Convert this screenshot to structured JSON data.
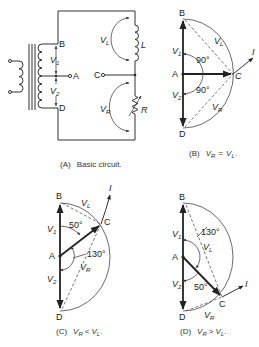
{
  "figure": {
    "panels": [
      {
        "id": "A",
        "caption_tag": "(A)",
        "caption_text": "Basic circuit.",
        "labels": {
          "B": "B",
          "A": "A",
          "C": "C",
          "D": "D",
          "V1": "V",
          "V1_sub": "1",
          "V2": "V",
          "V2_sub": "2",
          "VL": "V",
          "VL_sub": "L",
          "VR": "V",
          "VR_sub": "R",
          "L": "L",
          "R": "R"
        },
        "components": [
          "transformer",
          "inductor-L",
          "variable-resistor-R"
        ]
      },
      {
        "id": "B",
        "caption_tag": "(B)",
        "caption_expr": {
          "lhs": "V",
          "lhs_sub": "R",
          "op": "=",
          "rhs": "V",
          "rhs_sub": "L",
          "end": "."
        },
        "labels": {
          "B": "B",
          "A": "A",
          "C": "C",
          "D": "D",
          "I": "I",
          "V1": "V",
          "V1_sub": "1",
          "V2": "V",
          "V2_sub": "2",
          "VL": "V",
          "VL_sub": "L",
          "VR": "V",
          "VR_sub": "R"
        },
        "angles": [
          "90°",
          "90°"
        ]
      },
      {
        "id": "C",
        "caption_tag": "(C)",
        "caption_expr": {
          "lhs": "V",
          "lhs_sub": "R",
          "op": "<",
          "rhs": "V",
          "rhs_sub": "L",
          "end": "."
        },
        "labels": {
          "B": "B",
          "A": "A",
          "C": "C",
          "D": "D",
          "I": "I",
          "V1": "V",
          "V1_sub": "1",
          "V2": "V",
          "V2_sub": "2",
          "VL": "V",
          "VL_sub": "L",
          "VR": "V",
          "VR_sub": "R"
        },
        "angles": [
          "50°",
          "130°"
        ]
      },
      {
        "id": "D",
        "caption_tag": "(D)",
        "caption_expr": {
          "lhs": "V",
          "lhs_sub": "R",
          "op": ">",
          "rhs": "V",
          "rhs_sub": "L",
          "end": "."
        },
        "labels": {
          "B": "B",
          "A": "A",
          "C": "C",
          "D": "D",
          "I": "I",
          "V1": "V",
          "V1_sub": "1",
          "V2": "V",
          "V2_sub": "2",
          "VL": "V",
          "VL_sub": "L",
          "VR": "V",
          "VR_sub": "R"
        },
        "angles": [
          "130°",
          "50°"
        ]
      }
    ]
  }
}
